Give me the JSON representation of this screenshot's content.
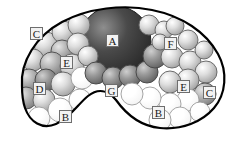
{
  "figure": {
    "background_color": "#ffffff",
    "outline_color": "#000000",
    "outline_width_px": 2.2,
    "width_px": 232,
    "height_px": 142
  },
  "labels": [
    {
      "id": "label-a",
      "text": "A",
      "x": 112,
      "y": 40,
      "target": "large-dark-sphere"
    },
    {
      "id": "label-c-left",
      "text": "C",
      "x": 36,
      "y": 33,
      "target": "upper-left-pale-sphere"
    },
    {
      "id": "label-e-left",
      "text": "E",
      "x": 66,
      "y": 62,
      "target": "mid-left-pale-sphere"
    },
    {
      "id": "label-d",
      "text": "D",
      "x": 39,
      "y": 88,
      "target": "lower-left-mid-sphere"
    },
    {
      "id": "label-b-left",
      "text": "B",
      "x": 65,
      "y": 116,
      "target": "lower-left-void"
    },
    {
      "id": "label-g",
      "text": "G",
      "x": 111,
      "y": 90,
      "target": "inner-notch-boundary"
    },
    {
      "id": "label-f",
      "text": "F",
      "x": 170,
      "y": 43,
      "target": "upper-right-pale-sphere"
    },
    {
      "id": "label-e-right",
      "text": "E",
      "x": 183,
      "y": 86,
      "target": "lower-right-pale-sphere"
    },
    {
      "id": "label-c-right",
      "text": "C",
      "x": 209,
      "y": 92,
      "target": "right-edge-sphere"
    },
    {
      "id": "label-b-right",
      "text": "B",
      "x": 158,
      "y": 112,
      "target": "lower-right-void"
    }
  ],
  "legend_keys": [
    {
      "key": "A",
      "meaning": "large central dark sphere"
    },
    {
      "key": "B",
      "meaning": "unfilled void region"
    },
    {
      "key": "C",
      "meaning": "pale peripheral sphere"
    },
    {
      "key": "D",
      "meaning": "mid-tone sphere cluster"
    },
    {
      "key": "E",
      "meaning": "light shaded sphere"
    },
    {
      "key": "F",
      "meaning": "upper right sphere group"
    },
    {
      "key": "G",
      "meaning": "concave inner boundary"
    }
  ],
  "shapes": {
    "outline_path": "M 22 86 C 20 62 36 36 62 22 C 88 8 124 4 152 10 C 182 16 206 32 218 54 C 228 72 226 94 214 108 C 202 122 182 130 160 128 C 140 126 126 114 116 100 C 108 90 98 88 88 96 C 78 104 70 118 56 124 C 42 130 30 122 25 108 C 22 99 22 92 22 86 Z",
    "spheres": [
      {
        "cx": 115,
        "cy": 42,
        "r": 36,
        "tone": "dark",
        "name": "large-dark-sphere"
      },
      {
        "cx": 46,
        "cy": 44,
        "r": 12,
        "tone": "pale",
        "name": "sphere-ul-1"
      },
      {
        "cx": 63,
        "cy": 32,
        "r": 11,
        "tone": "pale",
        "name": "sphere-ul-2"
      },
      {
        "cx": 79,
        "cy": 25,
        "r": 11,
        "tone": "pale",
        "name": "sphere-ul-3"
      },
      {
        "cx": 62,
        "cy": 51,
        "r": 11,
        "tone": "mid",
        "name": "sphere-ul-4"
      },
      {
        "cx": 78,
        "cy": 44,
        "r": 11,
        "tone": "pale",
        "name": "sphere-ul-5"
      },
      {
        "cx": 33,
        "cy": 60,
        "r": 11,
        "tone": "pale",
        "name": "sphere-l-1"
      },
      {
        "cx": 52,
        "cy": 64,
        "r": 12,
        "tone": "mid",
        "name": "sphere-l-2"
      },
      {
        "cx": 72,
        "cy": 66,
        "r": 12,
        "tone": "pale",
        "name": "sphere-l-3"
      },
      {
        "cx": 88,
        "cy": 56,
        "r": 10,
        "tone": "pale",
        "name": "sphere-l-4"
      },
      {
        "cx": 29,
        "cy": 80,
        "r": 11,
        "tone": "mid",
        "name": "sphere-ll-1"
      },
      {
        "cx": 46,
        "cy": 80,
        "r": 11,
        "tone": "darkmid",
        "name": "sphere-ll-2"
      },
      {
        "cx": 63,
        "cy": 84,
        "r": 12,
        "tone": "pale",
        "name": "sphere-ll-3"
      },
      {
        "cx": 26,
        "cy": 98,
        "r": 11,
        "tone": "mid",
        "name": "sphere-ll-4"
      },
      {
        "cx": 44,
        "cy": 100,
        "r": 11,
        "tone": "pale",
        "name": "sphere-ll-5"
      },
      {
        "cx": 39,
        "cy": 118,
        "r": 11,
        "tone": "void",
        "name": "void-ll-1"
      },
      {
        "cx": 60,
        "cy": 110,
        "r": 12,
        "tone": "void",
        "name": "void-ll-2"
      },
      {
        "cx": 80,
        "cy": 100,
        "r": 11,
        "tone": "void",
        "name": "void-ll-3"
      },
      {
        "cx": 82,
        "cy": 78,
        "r": 11,
        "tone": "void",
        "name": "void-ml-1"
      },
      {
        "cx": 96,
        "cy": 73,
        "r": 11,
        "tone": "darkmid",
        "name": "sphere-c-1"
      },
      {
        "cx": 113,
        "cy": 78,
        "r": 11,
        "tone": "darkmid",
        "name": "sphere-c-2"
      },
      {
        "cx": 130,
        "cy": 76,
        "r": 11,
        "tone": "darkmid",
        "name": "sphere-c-3"
      },
      {
        "cx": 147,
        "cy": 72,
        "r": 11,
        "tone": "darkmid",
        "name": "sphere-c-4"
      },
      {
        "cx": 155,
        "cy": 56,
        "r": 12,
        "tone": "darkmid",
        "name": "sphere-c-5"
      },
      {
        "cx": 149,
        "cy": 25,
        "r": 10,
        "tone": "pale",
        "name": "sphere-ur-1"
      },
      {
        "cx": 164,
        "cy": 30,
        "r": 9,
        "tone": "pale",
        "name": "sphere-ur-2"
      },
      {
        "cx": 175,
        "cy": 26,
        "r": 9,
        "tone": "pale",
        "name": "sphere-ur-3"
      },
      {
        "cx": 188,
        "cy": 40,
        "r": 10,
        "tone": "pale",
        "name": "sphere-ur-4"
      },
      {
        "cx": 172,
        "cy": 57,
        "r": 11,
        "tone": "pale",
        "name": "sphere-ur-5"
      },
      {
        "cx": 190,
        "cy": 62,
        "r": 11,
        "tone": "pale",
        "name": "sphere-ur-6"
      },
      {
        "cx": 204,
        "cy": 50,
        "r": 9,
        "tone": "pale",
        "name": "sphere-ur-7"
      },
      {
        "cx": 160,
        "cy": 42,
        "r": 8,
        "tone": "pale",
        "name": "sphere-ur-8"
      },
      {
        "cx": 206,
        "cy": 72,
        "r": 11,
        "tone": "pale",
        "name": "sphere-r-1"
      },
      {
        "cx": 188,
        "cy": 80,
        "r": 11,
        "tone": "pale",
        "name": "sphere-r-2"
      },
      {
        "cx": 170,
        "cy": 82,
        "r": 11,
        "tone": "pale",
        "name": "sphere-r-3"
      },
      {
        "cx": 205,
        "cy": 94,
        "r": 11,
        "tone": "mid",
        "name": "sphere-r-4"
      },
      {
        "cx": 188,
        "cy": 100,
        "r": 11,
        "tone": "void",
        "name": "void-r-1"
      },
      {
        "cx": 170,
        "cy": 104,
        "r": 11,
        "tone": "void",
        "name": "void-r-2"
      },
      {
        "cx": 150,
        "cy": 98,
        "r": 11,
        "tone": "void",
        "name": "void-r-3"
      },
      {
        "cx": 132,
        "cy": 94,
        "r": 11,
        "tone": "void",
        "name": "void-r-4"
      },
      {
        "cx": 200,
        "cy": 112,
        "r": 10,
        "tone": "void",
        "name": "void-r-5"
      },
      {
        "cx": 180,
        "cy": 118,
        "r": 11,
        "tone": "void",
        "name": "void-r-6"
      },
      {
        "cx": 160,
        "cy": 120,
        "r": 11,
        "tone": "void",
        "name": "void-r-7"
      }
    ]
  },
  "tones": {
    "dark": {
      "fill": "#4a4a4a",
      "highlight": "#8e8e8e",
      "shadow": "#262626",
      "stroke": "#1f1f1f"
    },
    "darkmid": {
      "fill": "#9a9a9a",
      "highlight": "#cfcfcf",
      "shadow": "#5d5d5d",
      "stroke": "#4a4a4a"
    },
    "mid": {
      "fill": "#b8b8b8",
      "highlight": "#e6e6e6",
      "shadow": "#7a7a7a",
      "stroke": "#555555"
    },
    "pale": {
      "fill": "#dedede",
      "highlight": "#ffffff",
      "shadow": "#9e9e9e",
      "stroke": "#6b6b6b"
    },
    "void": {
      "fill": "#ffffff",
      "highlight": "#ffffff",
      "shadow": "#f2f2f2",
      "stroke": "#9b9b9b"
    }
  }
}
